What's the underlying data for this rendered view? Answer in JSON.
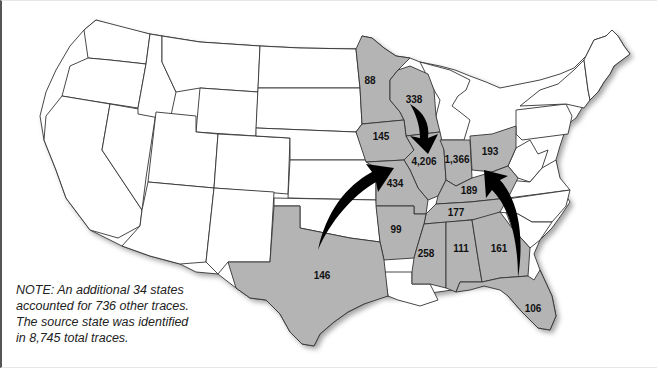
{
  "map": {
    "type": "choropleth",
    "region": "Contiguous United States",
    "highlight_color": "#b4b4b4",
    "base_color": "#ffffff",
    "highlighted_states": [
      {
        "state": "Minnesota",
        "value": "88"
      },
      {
        "state": "Wisconsin",
        "value": "338"
      },
      {
        "state": "Iowa",
        "value": "145"
      },
      {
        "state": "Illinois",
        "value": "4,206"
      },
      {
        "state": "Indiana",
        "value": "1,366"
      },
      {
        "state": "Ohio",
        "value": "193"
      },
      {
        "state": "Missouri",
        "value": "434"
      },
      {
        "state": "Kentucky",
        "value": "189"
      },
      {
        "state": "Tennessee",
        "value": "177"
      },
      {
        "state": "Arkansas",
        "value": "99"
      },
      {
        "state": "Texas",
        "value": "146"
      },
      {
        "state": "Mississippi",
        "value": "258"
      },
      {
        "state": "Alabama",
        "value": "111"
      },
      {
        "state": "Georgia",
        "value": "161"
      },
      {
        "state": "Florida",
        "value": "106"
      }
    ],
    "arrows": [
      {
        "from": "Wisconsin",
        "to": "Illinois"
      },
      {
        "from": "Texas",
        "to": "Missouri"
      },
      {
        "from": "Florida",
        "to": "Kentucky"
      }
    ]
  },
  "note": {
    "lines": [
      "NOTE: An additional 34 states",
      "accounted for 736 other traces.",
      "The source state was identified",
      "in 8,745 total traces."
    ]
  }
}
